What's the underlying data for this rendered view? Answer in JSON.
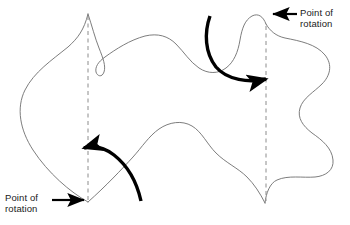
{
  "figure": {
    "background_color": "#ffffff",
    "outline_color": "#6e6e6e",
    "dash_color": "#8c8c8c",
    "arrow_color": "#000000",
    "text_color": "#1a1a1a"
  },
  "labels": {
    "top_right": {
      "line1": "Point of",
      "line2": "rotation",
      "pointer_direction": "left"
    },
    "bottom_left": {
      "line1": "Point of",
      "line2": "rotation",
      "pointer_direction": "right"
    }
  },
  "annotations": {
    "rotation_arrow_left": {
      "name": "counterclockwise rotation arrow",
      "direction": "counterclockwise",
      "arrowhead_direction": "left"
    },
    "rotation_arrow_right": {
      "name": "clockwise rotation arrow",
      "direction": "clockwise",
      "arrowhead_direction": "right"
    },
    "axis_left": {
      "name": "vertical dashed axis through left point of rotation",
      "style": "dashed"
    },
    "axis_right": {
      "name": "vertical dashed axis through right point of rotation",
      "style": "dashed"
    }
  }
}
